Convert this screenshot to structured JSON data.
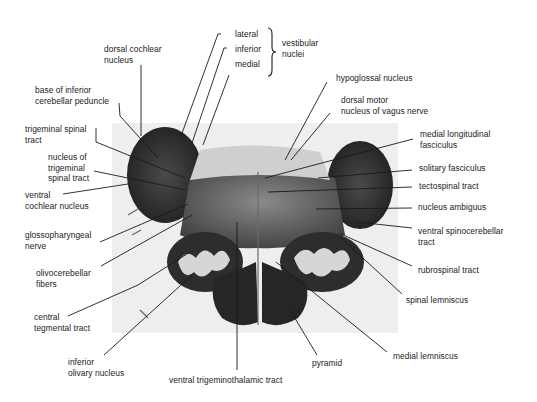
{
  "figure": {
    "labels": {
      "dorsal_cochlear_nucleus": "dorsal cochlear\nnucleus",
      "lateral": "lateral",
      "inferior": "inferior",
      "medial": "medial",
      "vestibular_nuclei": "vestibular\nnuclei",
      "base_inferior_cerebellar_peduncle": "base of inferior\ncerebellar peduncle",
      "hypoglossal_nucleus": "hypoglossal nucleus",
      "dorsal_motor_nucleus_vagus": "dorsal motor\nnucleus of vagus nerve",
      "trigeminal_spinal_tract": "trigeminal spinal\ntract",
      "nucleus_trigeminal_spinal_tract": "nucleus of\ntrigeminal\nspinal tract",
      "medial_longitudinal_fasciculus": "medial longitudinal\nfasciculus",
      "solitary_fasciculus": "solitary fasciculus",
      "ventral_cochlear_nucleus": "ventral\ncochlear nucleus",
      "tectospinal_tract": "tectospinal tract",
      "nucleus_ambiguus": "nucleus ambiguus",
      "glossopharyngeal_nerve": "glossopharyngeal\nnerve",
      "ventral_spinocerebellar_tract": "ventral spinocerebellar\ntract",
      "olivocerebellar_fibers": "olivocerebellar\nfibers",
      "rubrospinal_tract": "rubrospinal tract",
      "central_tegmental_tract": "central\ntegmental tract",
      "spinal_lemniscus": "spinal lemniscus",
      "inferior_olivary_nucleus": "inferior\nolivary nucleus",
      "pyramid": "pyramid",
      "medial_lemniscus": "medial lemniscus",
      "ventral_trigeminothalamic_tract": "ventral trigeminothalamic tract"
    },
    "colors": {
      "background": "#ffffff",
      "photo_background": "#eeeeee",
      "tissue_dark": "#2a2a2a",
      "tissue_mid": "#5a5a5a",
      "olive_light": "#d8d8d8",
      "leader_line": "#1a1a1a"
    }
  }
}
